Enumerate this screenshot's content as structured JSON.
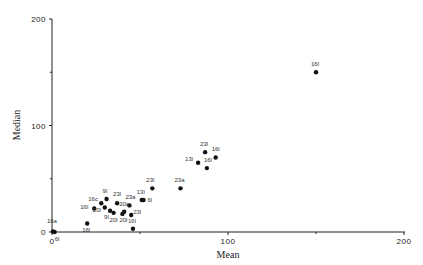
{
  "chart_data": {
    "type": "scatter",
    "title": "",
    "xlabel": "Mean",
    "ylabel": "Median",
    "xlim": [
      0,
      200
    ],
    "ylim": [
      0,
      200
    ],
    "xticks": [
      0,
      100,
      200
    ],
    "yticks": [
      0,
      100,
      200
    ],
    "grid": false,
    "legend": null,
    "points": [
      {
        "label": "16a",
        "x": 0.5,
        "y": 0.5
      },
      {
        "label": "6l",
        "x": 1.5,
        "y": 0
      },
      {
        "label": "16l",
        "x": 20,
        "y": 8
      },
      {
        "label": "16l",
        "x": 24,
        "y": 22
      },
      {
        "label": "16c",
        "x": 28,
        "y": 27
      },
      {
        "label": "20l",
        "x": 30,
        "y": 23
      },
      {
        "label": "9l",
        "x": 31,
        "y": 31
      },
      {
        "label": "23l",
        "x": 37,
        "y": 27
      },
      {
        "label": "9l",
        "x": 33,
        "y": 20
      },
      {
        "label": "20l",
        "x": 35,
        "y": 18
      },
      {
        "label": "20l",
        "x": 40,
        "y": 17
      },
      {
        "label": "23a",
        "x": 44,
        "y": 25
      },
      {
        "label": "20a",
        "x": 41,
        "y": 19
      },
      {
        "label": "23l",
        "x": 45,
        "y": 16
      },
      {
        "label": "13l",
        "x": 51,
        "y": 30
      },
      {
        "label": "6l",
        "x": 52,
        "y": 30
      },
      {
        "label": "16l",
        "x": 46,
        "y": 3
      },
      {
        "label": "23l",
        "x": 57,
        "y": 41
      },
      {
        "label": "23a",
        "x": 73,
        "y": 41
      },
      {
        "label": "13l",
        "x": 83,
        "y": 65
      },
      {
        "label": "23l",
        "x": 87,
        "y": 75
      },
      {
        "label": "16l",
        "x": 88,
        "y": 60
      },
      {
        "label": "16l",
        "x": 93,
        "y": 70
      },
      {
        "label": "16l",
        "x": 150,
        "y": 150
      }
    ]
  },
  "axes": {
    "x_title": "Mean",
    "y_title": "Median",
    "x_ticks": [
      "0",
      "100",
      "200"
    ],
    "y_ticks": [
      "0",
      "100",
      "200"
    ]
  }
}
